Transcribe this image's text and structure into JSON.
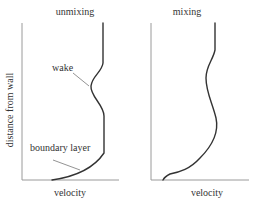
{
  "diagram": {
    "y_axis_label": "distance from wall",
    "panels": [
      {
        "id": "left",
        "title": "unmixing",
        "x_axis_label": "velocity",
        "annotations": [
          {
            "text": "wake"
          },
          {
            "text": "boundary layer"
          }
        ]
      },
      {
        "id": "right",
        "title": "mixing",
        "x_axis_label": "velocity",
        "annotations": []
      }
    ],
    "colors": {
      "axis": "#9a9a9a",
      "curve": "#333333",
      "text": "#333333",
      "pointer": "#777777"
    }
  }
}
